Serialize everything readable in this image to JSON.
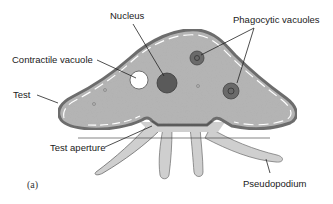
{
  "figure": {
    "panel_label": "(a)",
    "labels": {
      "nucleus": "Nucleus",
      "phagocytic_vacuoles": "Phagocytic vacuoles",
      "contractile_vacuole": "Contractile vacuole",
      "test": "Test",
      "test_aperture": "Test aperture",
      "pseudopodium": "Pseudopodium"
    },
    "colors": {
      "cytoplasm": "#b8b8b8",
      "test_outline": "#6e6e6e",
      "pseudopodium": "#d0d0d0",
      "nucleus": "#555555",
      "vacuole_dark": "#666666",
      "contractile_vacuole": "#ffffff",
      "leader_line": "#222222"
    }
  }
}
